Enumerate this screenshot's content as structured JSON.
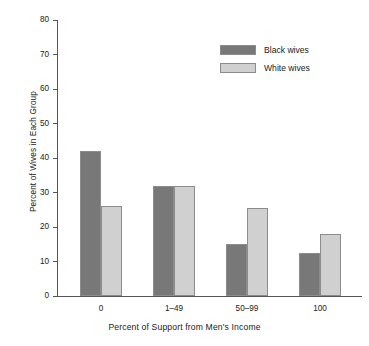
{
  "chart_data": {
    "type": "bar",
    "title": "",
    "xlabel": "Percent of Support from Men's Income",
    "ylabel": "Percent of Wives in Each Group",
    "categories": [
      "0",
      "1–49",
      "50–99",
      "100"
    ],
    "series": [
      {
        "name": "Black wives",
        "color": "#787878",
        "values": [
          42,
          32,
          15,
          12.5
        ]
      },
      {
        "name": "White wives",
        "color": "#d0d0d0",
        "values": [
          26,
          32,
          25.5,
          18
        ]
      }
    ],
    "ylim": [
      0,
      80
    ],
    "ytick_labels": [
      "0",
      "10",
      "20",
      "30",
      "40",
      "50",
      "60",
      "70",
      "80"
    ],
    "ytick_values": [
      0,
      10,
      20,
      30,
      40,
      50,
      60,
      70,
      80
    ],
    "grid": false,
    "legend_position": "top-right",
    "legend_entries": [
      "Black wives",
      "White wives"
    ]
  }
}
